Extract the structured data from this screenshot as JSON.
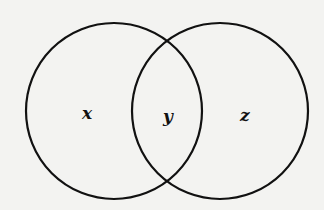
{
  "diagram": {
    "type": "venn",
    "stroke_color": "#111111",
    "background_color": "#f3f3f1",
    "circles": [
      {
        "id": "left",
        "cx": 114,
        "cy": 111,
        "r": 88
      },
      {
        "id": "right",
        "cx": 220,
        "cy": 111,
        "r": 88
      }
    ],
    "regions": [
      {
        "id": "left-only",
        "label": "x"
      },
      {
        "id": "intersection",
        "label": "y"
      },
      {
        "id": "right-only",
        "label": "z"
      }
    ]
  }
}
